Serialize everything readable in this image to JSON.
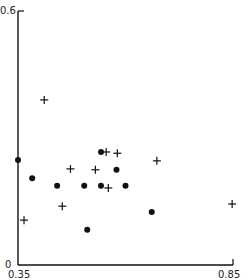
{
  "chart_data": {
    "type": "scatter",
    "title": "",
    "xlabel": "",
    "ylabel": "",
    "xlim": [
      0.35,
      0.85
    ],
    "ylim": [
      0,
      0.6
    ],
    "grid": false,
    "legend": null,
    "x_tick_labels": [
      "0.35",
      "0.85"
    ],
    "y_tick_labels": [
      "0",
      "0.6"
    ],
    "series": [
      {
        "name": "dots",
        "marker": "filled-circle",
        "points": [
          {
            "x": 0.35,
            "y": 0.248
          },
          {
            "x": 0.383,
            "y": 0.205
          },
          {
            "x": 0.441,
            "y": 0.187
          },
          {
            "x": 0.504,
            "y": 0.187
          },
          {
            "x": 0.511,
            "y": 0.083
          },
          {
            "x": 0.543,
            "y": 0.267
          },
          {
            "x": 0.543,
            "y": 0.187
          },
          {
            "x": 0.579,
            "y": 0.225
          },
          {
            "x": 0.6,
            "y": 0.187
          },
          {
            "x": 0.661,
            "y": 0.125
          }
        ]
      },
      {
        "name": "crosses",
        "marker": "plus",
        "points": [
          {
            "x": 0.364,
            "y": 0.106
          },
          {
            "x": 0.411,
            "y": 0.39
          },
          {
            "x": 0.453,
            "y": 0.139
          },
          {
            "x": 0.472,
            "y": 0.227
          },
          {
            "x": 0.53,
            "y": 0.225
          },
          {
            "x": 0.555,
            "y": 0.267
          },
          {
            "x": 0.56,
            "y": 0.182
          },
          {
            "x": 0.581,
            "y": 0.264
          },
          {
            "x": 0.673,
            "y": 0.246
          },
          {
            "x": 0.848,
            "y": 0.144
          }
        ]
      }
    ]
  }
}
